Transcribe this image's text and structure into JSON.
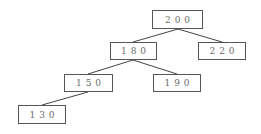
{
  "diagram": {
    "type": "binary-search-tree",
    "nodes": [
      {
        "id": "n200",
        "label": "200",
        "x": 152,
        "y": 10,
        "w": 51,
        "h": 19
      },
      {
        "id": "n180",
        "label": "180",
        "x": 110,
        "y": 42,
        "w": 47,
        "h": 18
      },
      {
        "id": "n220",
        "label": "220",
        "x": 198,
        "y": 42,
        "w": 48,
        "h": 18
      },
      {
        "id": "n150",
        "label": "150",
        "x": 64,
        "y": 74,
        "w": 49,
        "h": 18
      },
      {
        "id": "n190",
        "label": "190",
        "x": 153,
        "y": 74,
        "w": 48,
        "h": 18
      },
      {
        "id": "n130",
        "label": "130",
        "x": 18,
        "y": 105,
        "w": 48,
        "h": 19
      }
    ],
    "edges": [
      {
        "from": "200",
        "to": "180"
      },
      {
        "from": "200",
        "to": "220"
      },
      {
        "from": "180",
        "to": "150"
      },
      {
        "from": "180",
        "to": "190"
      },
      {
        "from": "150",
        "to": "130"
      }
    ],
    "colors": {
      "border": "#555555",
      "text": "#6a6a6a",
      "edge": "#444444"
    }
  }
}
